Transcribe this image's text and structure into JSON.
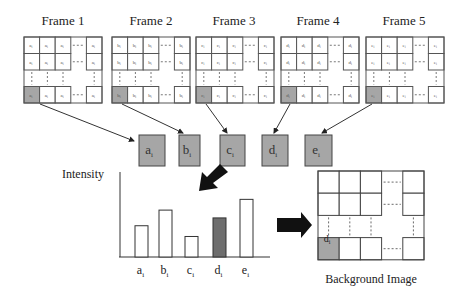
{
  "diagram": {
    "frames": [
      {
        "title": "Frame 1",
        "pixel": "a",
        "x": 24
      },
      {
        "title": "Frame 2",
        "pixel": "b",
        "x": 112
      },
      {
        "title": "Frame 3",
        "pixel": "c",
        "x": 196
      },
      {
        "title": "Frame 4",
        "pixel": "d",
        "x": 281
      },
      {
        "title": "Frame 5",
        "pixel": "e",
        "x": 366
      }
    ],
    "pixel_boxes": [
      {
        "label": "a",
        "sub": "i"
      },
      {
        "label": "b",
        "sub": "i"
      },
      {
        "label": "c",
        "sub": "i"
      },
      {
        "label": "d",
        "sub": "i"
      },
      {
        "label": "e",
        "sub": "i"
      }
    ],
    "intensity_label": "Intensity",
    "background_label": "Background Image",
    "selected_pixel": {
      "label": "d",
      "sub": "i"
    },
    "colors": {
      "selected_fill": "#a6a6a6",
      "selected_bar": "#6e6e6e",
      "grid_line": "#555555",
      "arrow": "#111111"
    }
  },
  "chart_data": {
    "type": "bar",
    "title": "",
    "xlabel": "",
    "ylabel": "Intensity",
    "categories": [
      "a_i",
      "b_i",
      "c_i",
      "d_i",
      "e_i"
    ],
    "values": [
      32,
      48,
      21,
      40,
      59
    ],
    "highlighted": "d_i",
    "ylim": [
      0,
      87
    ],
    "grid": false
  }
}
